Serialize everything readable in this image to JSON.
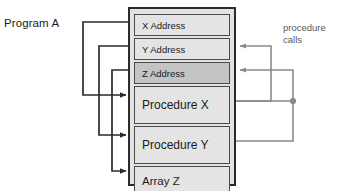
{
  "diagram": {
    "title_label": "Program A",
    "annotation": {
      "line1": "procedure",
      "line2": "calls"
    },
    "colors": {
      "segment_fill": "#e4e4e4",
      "segment_fill_shaded": "#c4c4c4",
      "block_border": "#2b2b2b",
      "segment_border": "#4a4a4a",
      "pointer_wire": "#3a3a3a",
      "call_wire": "#808080",
      "annotation_text": "#595959"
    },
    "memory_block": {
      "name": "Program A memory layout",
      "segments": [
        {
          "id": "x-address",
          "label": "X Address",
          "kind": "address",
          "shaded": false
        },
        {
          "id": "y-address",
          "label": "Y Address",
          "kind": "address",
          "shaded": false
        },
        {
          "id": "z-address",
          "label": "Z Address",
          "kind": "address",
          "shaded": true
        },
        {
          "id": "procedure-x",
          "label": "Procedure X",
          "kind": "procedure",
          "shaded": false
        },
        {
          "id": "procedure-y",
          "label": "Procedure Y",
          "kind": "procedure",
          "shaded": false
        },
        {
          "id": "array-z",
          "label": "Array Z",
          "kind": "array",
          "shaded": false
        }
      ]
    },
    "pointer_edges": [
      {
        "from": "x-address",
        "to": "procedure-x"
      },
      {
        "from": "y-address",
        "to": "procedure-y"
      },
      {
        "from": "z-address",
        "to": "array-z"
      }
    ],
    "call_edges": [
      {
        "from": "procedure-x",
        "to": "y-address"
      },
      {
        "from": "procedure-y",
        "to": "z-address"
      }
    ],
    "junction_dot": {
      "name": "call-wire-junction"
    }
  }
}
